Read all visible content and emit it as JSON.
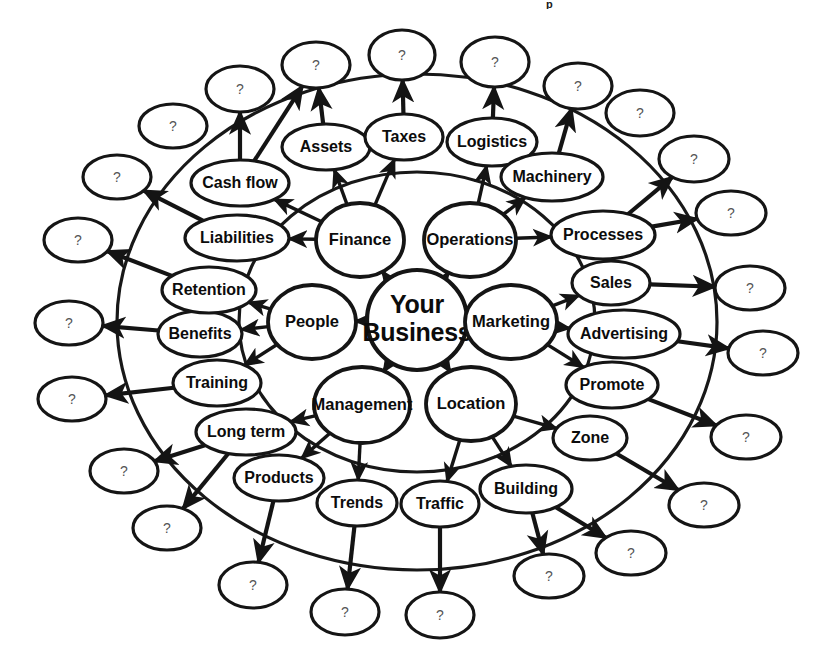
{
  "title_fragment": "p",
  "diagram": {
    "type": "radial-mind-map",
    "center": {
      "label": "Your Business",
      "lines": [
        "Your",
        "Business"
      ],
      "cx": 417,
      "cy": 320,
      "rx": 50,
      "ry": 50
    },
    "ring1_label": "core-business-areas",
    "ring2_label": "sub-topics",
    "ring3_label": "unknown-placeholders",
    "core_nodes": [
      {
        "id": "finance",
        "label": "Finance",
        "cx": 360,
        "cy": 240,
        "rx": 44,
        "ry": 37
      },
      {
        "id": "operations",
        "label": "Operations",
        "cx": 470,
        "cy": 240,
        "rx": 46,
        "ry": 37
      },
      {
        "id": "marketing",
        "label": "Marketing",
        "cx": 511,
        "cy": 322,
        "rx": 46,
        "ry": 37
      },
      {
        "id": "location",
        "label": "Location",
        "cx": 471,
        "cy": 404,
        "rx": 45,
        "ry": 37
      },
      {
        "id": "management",
        "label": "Management",
        "cx": 362,
        "cy": 405,
        "rx": 48,
        "ry": 38
      },
      {
        "id": "people",
        "label": "People",
        "cx": 312,
        "cy": 322,
        "rx": 44,
        "ry": 37
      }
    ],
    "mid_nodes": [
      {
        "id": "cash-flow",
        "label": "Cash flow",
        "cx": 240,
        "cy": 183,
        "rx": 49,
        "ry": 23
      },
      {
        "id": "assets",
        "label": "Assets",
        "cx": 326,
        "cy": 147,
        "rx": 44,
        "ry": 23
      },
      {
        "id": "taxes",
        "label": "Taxes",
        "cx": 404,
        "cy": 137,
        "rx": 39,
        "ry": 23
      },
      {
        "id": "logistics",
        "label": "Logistics",
        "cx": 492,
        "cy": 142,
        "rx": 45,
        "ry": 24
      },
      {
        "id": "machinery",
        "label": "Machinery",
        "cx": 552,
        "cy": 177,
        "rx": 51,
        "ry": 24
      },
      {
        "id": "processes",
        "label": "Processes",
        "cx": 603,
        "cy": 235,
        "rx": 52,
        "ry": 24
      },
      {
        "id": "sales",
        "label": "Sales",
        "cx": 611,
        "cy": 283,
        "rx": 39,
        "ry": 22
      },
      {
        "id": "advertising",
        "label": "Advertising",
        "cx": 624,
        "cy": 334,
        "rx": 56,
        "ry": 24
      },
      {
        "id": "promote",
        "label": "Promote",
        "cx": 612,
        "cy": 385,
        "rx": 46,
        "ry": 23
      },
      {
        "id": "zone",
        "label": "Zone",
        "cx": 590,
        "cy": 438,
        "rx": 37,
        "ry": 22
      },
      {
        "id": "building",
        "label": "Building",
        "cx": 526,
        "cy": 489,
        "rx": 46,
        "ry": 24
      },
      {
        "id": "traffic",
        "label": "Traffic",
        "cx": 440,
        "cy": 504,
        "rx": 39,
        "ry": 23
      },
      {
        "id": "trends",
        "label": "Trends",
        "cx": 357,
        "cy": 503,
        "rx": 40,
        "ry": 23
      },
      {
        "id": "products",
        "label": "Products",
        "cx": 279,
        "cy": 478,
        "rx": 45,
        "ry": 23
      },
      {
        "id": "long-term",
        "label": "Long term",
        "cx": 246,
        "cy": 432,
        "rx": 50,
        "ry": 23
      },
      {
        "id": "training",
        "label": "Training",
        "cx": 217,
        "cy": 383,
        "rx": 44,
        "ry": 23
      },
      {
        "id": "benefits",
        "label": "Benefits",
        "cx": 200,
        "cy": 334,
        "rx": 42,
        "ry": 23
      },
      {
        "id": "retention",
        "label": "Retention",
        "cx": 209,
        "cy": 290,
        "rx": 47,
        "ry": 23
      },
      {
        "id": "liabilities",
        "label": "Liabilities",
        "cx": 237,
        "cy": 238,
        "rx": 52,
        "ry": 23
      }
    ],
    "outer_nodes": [
      {
        "id": "q-01",
        "label": "?",
        "cx": 173,
        "cy": 126,
        "rx": 34,
        "ry": 22
      },
      {
        "id": "q-02",
        "label": "?",
        "cx": 240,
        "cy": 89,
        "rx": 34,
        "ry": 23
      },
      {
        "id": "q-03",
        "label": "?",
        "cx": 316,
        "cy": 65,
        "rx": 34,
        "ry": 23
      },
      {
        "id": "q-04",
        "label": "?",
        "cx": 402,
        "cy": 55,
        "rx": 33,
        "ry": 25
      },
      {
        "id": "q-05",
        "label": "?",
        "cx": 495,
        "cy": 62,
        "rx": 34,
        "ry": 25
      },
      {
        "id": "q-06",
        "label": "?",
        "cx": 578,
        "cy": 86,
        "rx": 34,
        "ry": 23
      },
      {
        "id": "q-07",
        "label": "?",
        "cx": 640,
        "cy": 113,
        "rx": 34,
        "ry": 23
      },
      {
        "id": "q-08",
        "label": "?",
        "cx": 694,
        "cy": 159,
        "rx": 35,
        "ry": 23
      },
      {
        "id": "q-09",
        "label": "?",
        "cx": 731,
        "cy": 213,
        "rx": 35,
        "ry": 22
      },
      {
        "id": "q-10",
        "label": "?",
        "cx": 750,
        "cy": 288,
        "rx": 35,
        "ry": 22
      },
      {
        "id": "q-11",
        "label": "?",
        "cx": 763,
        "cy": 353,
        "rx": 35,
        "ry": 22
      },
      {
        "id": "q-12",
        "label": "?",
        "cx": 746,
        "cy": 437,
        "rx": 35,
        "ry": 22
      },
      {
        "id": "q-13",
        "label": "?",
        "cx": 704,
        "cy": 505,
        "rx": 35,
        "ry": 22
      },
      {
        "id": "q-14",
        "label": "?",
        "cx": 631,
        "cy": 553,
        "rx": 35,
        "ry": 22
      },
      {
        "id": "q-15",
        "label": "?",
        "cx": 549,
        "cy": 576,
        "rx": 35,
        "ry": 22
      },
      {
        "id": "q-16",
        "label": "?",
        "cx": 440,
        "cy": 615,
        "rx": 34,
        "ry": 23
      },
      {
        "id": "q-17",
        "label": "?",
        "cx": 345,
        "cy": 612,
        "rx": 34,
        "ry": 23
      },
      {
        "id": "q-18",
        "label": "?",
        "cx": 253,
        "cy": 585,
        "rx": 34,
        "ry": 23
      },
      {
        "id": "q-19",
        "label": "?",
        "cx": 167,
        "cy": 528,
        "rx": 34,
        "ry": 22
      },
      {
        "id": "q-20",
        "label": "?",
        "cx": 124,
        "cy": 471,
        "rx": 34,
        "ry": 22
      },
      {
        "id": "q-21",
        "label": "?",
        "cx": 72,
        "cy": 399,
        "rx": 34,
        "ry": 22
      },
      {
        "id": "q-22",
        "label": "?",
        "cx": 69,
        "cy": 323,
        "rx": 34,
        "ry": 22
      },
      {
        "id": "q-23",
        "label": "?",
        "cx": 78,
        "cy": 240,
        "rx": 34,
        "ry": 22
      },
      {
        "id": "q-24",
        "label": "?",
        "cx": 117,
        "cy": 177,
        "rx": 34,
        "ry": 22
      }
    ],
    "edges": [
      {
        "from": "center",
        "to": "finance"
      },
      {
        "from": "center",
        "to": "operations"
      },
      {
        "from": "center",
        "to": "marketing"
      },
      {
        "from": "center",
        "to": "location"
      },
      {
        "from": "center",
        "to": "management"
      },
      {
        "from": "center",
        "to": "people"
      },
      {
        "from": "finance",
        "to": "cash-flow"
      },
      {
        "from": "finance",
        "to": "assets"
      },
      {
        "from": "finance",
        "to": "taxes"
      },
      {
        "from": "finance",
        "to": "liabilities"
      },
      {
        "from": "operations",
        "to": "logistics"
      },
      {
        "from": "operations",
        "to": "machinery"
      },
      {
        "from": "operations",
        "to": "processes"
      },
      {
        "from": "marketing",
        "to": "sales"
      },
      {
        "from": "marketing",
        "to": "advertising"
      },
      {
        "from": "marketing",
        "to": "promote"
      },
      {
        "from": "location",
        "to": "zone"
      },
      {
        "from": "location",
        "to": "building"
      },
      {
        "from": "location",
        "to": "traffic"
      },
      {
        "from": "management",
        "to": "trends"
      },
      {
        "from": "management",
        "to": "products"
      },
      {
        "from": "management",
        "to": "long-term"
      },
      {
        "from": "people",
        "to": "training"
      },
      {
        "from": "people",
        "to": "benefits"
      },
      {
        "from": "people",
        "to": "retention"
      },
      {
        "from": "cash-flow",
        "to": "q-02"
      },
      {
        "from": "cash-flow",
        "to": "q-03"
      },
      {
        "from": "assets",
        "to": "q-03"
      },
      {
        "from": "taxes",
        "to": "q-04"
      },
      {
        "from": "logistics",
        "to": "q-05"
      },
      {
        "from": "machinery",
        "to": "q-06"
      },
      {
        "from": "processes",
        "to": "q-08"
      },
      {
        "from": "processes",
        "to": "q-09"
      },
      {
        "from": "sales",
        "to": "q-10"
      },
      {
        "from": "advertising",
        "to": "q-11"
      },
      {
        "from": "promote",
        "to": "q-12"
      },
      {
        "from": "zone",
        "to": "q-13"
      },
      {
        "from": "building",
        "to": "q-14"
      },
      {
        "from": "building",
        "to": "q-15"
      },
      {
        "from": "traffic",
        "to": "q-16"
      },
      {
        "from": "trends",
        "to": "q-17"
      },
      {
        "from": "products",
        "to": "q-18"
      },
      {
        "from": "long-term",
        "to": "q-19"
      },
      {
        "from": "long-term",
        "to": "q-20"
      },
      {
        "from": "training",
        "to": "q-21"
      },
      {
        "from": "benefits",
        "to": "q-22"
      },
      {
        "from": "retention",
        "to": "q-23"
      },
      {
        "from": "liabilities",
        "to": "q-24"
      }
    ],
    "rings": [
      {
        "id": "inner-ring-arc",
        "cx": 417,
        "cy": 322,
        "rx": 178,
        "ry": 150
      },
      {
        "id": "outer-ring-arc",
        "cx": 417,
        "cy": 322,
        "rx": 300,
        "ry": 248
      }
    ],
    "colors": {
      "stroke": "#151515",
      "fill": "#ffffff",
      "text": "#0c0c0c",
      "placeholder_text": "#555555"
    }
  }
}
